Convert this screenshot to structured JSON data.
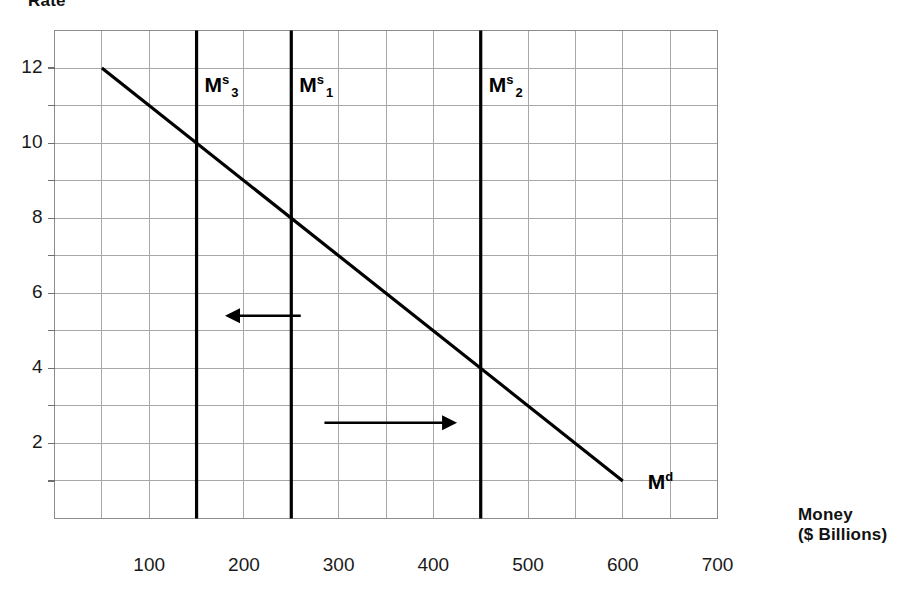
{
  "chart_data": {
    "type": "line",
    "title": "",
    "ylabel": "Rate",
    "xlabel": "Money",
    "xlabel_line2": "($ Billions)",
    "xlim": [
      0,
      700
    ],
    "ylim": [
      0,
      13
    ],
    "grid": true,
    "grid_x_step": 50,
    "grid_y_step": 1,
    "legend_position": "inline-annotations",
    "y_ticks": [
      "12",
      "10",
      "8",
      "6",
      "4",
      "2"
    ],
    "y_tick_values": [
      12,
      10,
      8,
      6,
      4,
      2
    ],
    "x_ticks": [
      "100",
      "200",
      "300",
      "400",
      "500",
      "600",
      "700"
    ],
    "x_tick_values": [
      100,
      200,
      300,
      400,
      500,
      600,
      700
    ],
    "series": [
      {
        "name": "Md",
        "kind": "demand-line",
        "points": [
          [
            50,
            12
          ],
          [
            600,
            1
          ]
        ]
      },
      {
        "name": "Ms3",
        "kind": "vertical-supply-line",
        "x": 150
      },
      {
        "name": "Ms1",
        "kind": "vertical-supply-line",
        "x": 250
      },
      {
        "name": "Ms2",
        "kind": "vertical-supply-line",
        "x": 450
      }
    ],
    "annotations": [
      {
        "name": "arrow-left",
        "direction": "left",
        "x_from": 260,
        "x_to": 180,
        "y": 5.4
      },
      {
        "name": "arrow-right",
        "direction": "right",
        "x_from": 285,
        "x_to": 425,
        "y": 2.55
      }
    ]
  },
  "labels": {
    "y_axis_title": "Rate",
    "x_axis_title": "Money",
    "x_axis_title_line2": "($ Billions)",
    "supply_3": {
      "base": "M",
      "sup": "s",
      "sub": "3"
    },
    "supply_1": {
      "base": "M",
      "sup": "s",
      "sub": "1"
    },
    "supply_2": {
      "base": "M",
      "sup": "s",
      "sub": "2"
    },
    "demand": {
      "base": "M",
      "sup": "d"
    }
  },
  "ticks": {
    "y": [
      {
        "text": "12"
      },
      {
        "text": "10"
      },
      {
        "text": "8"
      },
      {
        "text": "6"
      },
      {
        "text": "4"
      },
      {
        "text": "2"
      }
    ],
    "x": [
      {
        "text": "100"
      },
      {
        "text": "200"
      },
      {
        "text": "300"
      },
      {
        "text": "400"
      },
      {
        "text": "500"
      },
      {
        "text": "600"
      },
      {
        "text": "700"
      }
    ]
  },
  "colors": {
    "curve": "#000000",
    "grid": "#a8a8a8",
    "frame": "#8c8c8c",
    "text": "#000000",
    "background": "#ffffff"
  }
}
